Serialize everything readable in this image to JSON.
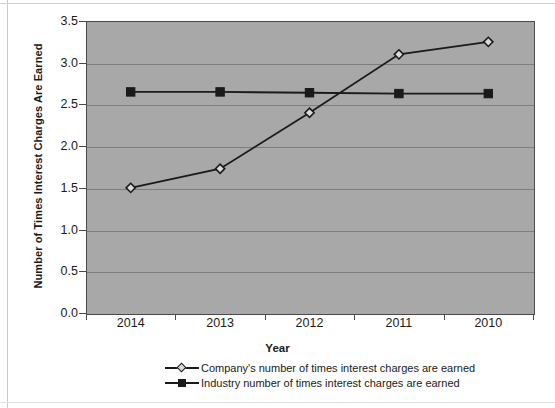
{
  "chart_data": {
    "type": "line",
    "title": "",
    "xlabel": "Year",
    "ylabel": "Number of Times Interest Charges Are Earned",
    "categories": [
      "2014",
      "2013",
      "2012",
      "2011",
      "2010"
    ],
    "ylim": [
      0.0,
      3.5
    ],
    "ytick_labels": [
      "0.0",
      "0.5",
      "1.0",
      "1.5",
      "2.0",
      "2.5",
      "3.0",
      "3.5"
    ],
    "ytick_values": [
      0.0,
      0.5,
      1.0,
      1.5,
      2.0,
      2.5,
      3.0,
      3.5
    ],
    "grid": true,
    "legend_position": "bottom",
    "plot_background_color": "#a8a8a8",
    "series": [
      {
        "name": "Company's number of times interest charges are earned",
        "marker": "diamond",
        "color": "#1a1a1a",
        "values": [
          1.5,
          1.73,
          2.4,
          3.1,
          3.25
        ]
      },
      {
        "name": "Industry number of times interest charges are earned",
        "marker": "square",
        "color": "#1a1a1a",
        "values": [
          2.65,
          2.65,
          2.64,
          2.63,
          2.63
        ]
      }
    ]
  },
  "legend": {
    "items": [
      {
        "label": "Company's number of times interest charges are earned",
        "marker": "diamond"
      },
      {
        "label": "Industry number of times interest charges are earned",
        "marker": "square"
      }
    ]
  }
}
